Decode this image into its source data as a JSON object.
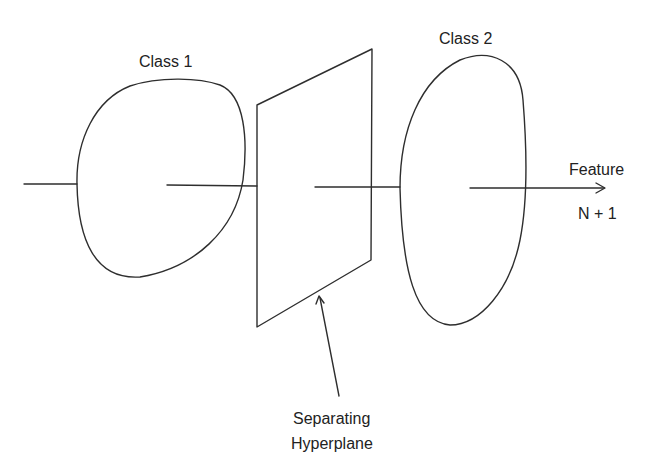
{
  "diagram": {
    "title": "",
    "labels": {
      "class1": "Class 1",
      "class2": "Class 2",
      "feature_line1": "Feature",
      "feature_line2": "N + 1",
      "hyperplane_line1": "Separating",
      "hyperplane_line2": "Hyperplane"
    },
    "colors": {
      "stroke": "#2e2e2e",
      "text": "#222222",
      "background": "#ffffff"
    }
  }
}
